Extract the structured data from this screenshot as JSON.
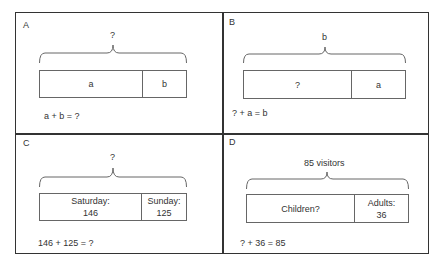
{
  "panels": [
    {
      "label": "A",
      "brace_label": "?",
      "bar": [
        {
          "text": "a"
        },
        {
          "text": "b"
        }
      ],
      "equation": "a + b = ?"
    },
    {
      "label": "B",
      "brace_label": "b",
      "bar": [
        {
          "text": "?"
        },
        {
          "text": "a"
        }
      ],
      "equation": "? + a = b"
    },
    {
      "label": "C",
      "brace_label": "?",
      "bar": [
        {
          "line1": "Saturday:",
          "line2": "146"
        },
        {
          "line1": "Sunday:",
          "line2": "125"
        }
      ],
      "equation": "146 + 125 = ?"
    },
    {
      "label": "D",
      "brace_label": "85 visitors",
      "bar": [
        {
          "text": "Children?"
        },
        {
          "line1": "Adults:",
          "line2": "36"
        }
      ],
      "equation": "? + 36 = 85"
    }
  ],
  "colors": {
    "border": "#333333",
    "bar_border": "#666666",
    "text": "#333333"
  }
}
